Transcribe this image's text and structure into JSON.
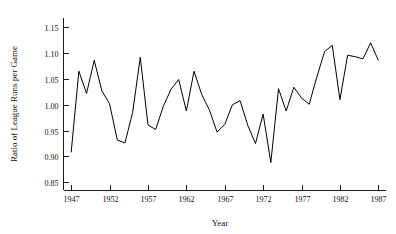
{
  "chart_data": {
    "type": "line",
    "title": "",
    "xlabel": "Year",
    "ylabel": "Ratio of League Runs per Game",
    "xlim": [
      1946,
      1988
    ],
    "ylim": [
      0.835,
      1.168
    ],
    "grid": false,
    "legend": "none",
    "xticks": [
      1947,
      1952,
      1957,
      1962,
      1967,
      1972,
      1977,
      1982,
      1987
    ],
    "xtick_labels": [
      "1947",
      "1952",
      "1957",
      "1962",
      "1967",
      "1972",
      "1977",
      "1982",
      "1987"
    ],
    "yticks": [
      0.85,
      0.9,
      0.95,
      1.0,
      1.05,
      1.1,
      1.15
    ],
    "ytick_labels": [
      "0.85",
      "0.90",
      "0.95",
      "1.00",
      "1.05",
      "1.10",
      "1.15"
    ],
    "x": [
      1947,
      1948,
      1949,
      1950,
      1951,
      1952,
      1953,
      1954,
      1955,
      1956,
      1957,
      1958,
      1959,
      1960,
      1961,
      1962,
      1963,
      1964,
      1965,
      1966,
      1967,
      1968,
      1969,
      1970,
      1971,
      1972,
      1973,
      1974,
      1975,
      1976,
      1977,
      1978,
      1979,
      1980,
      1981,
      1982,
      1983,
      1984,
      1985,
      1986,
      1987
    ],
    "values": [
      0.908,
      1.065,
      1.022,
      1.086,
      1.027,
      1.002,
      0.932,
      0.926,
      0.985,
      1.092,
      0.961,
      0.952,
      0.997,
      1.03,
      1.049,
      0.988,
      1.065,
      1.02,
      0.99,
      0.947,
      0.962,
      1.0,
      1.008,
      0.96,
      0.925,
      0.982,
      0.888,
      1.031,
      0.988,
      1.034,
      1.013,
      1.001,
      1.054,
      1.103,
      1.115,
      1.01,
      1.096,
      1.093,
      1.089,
      1.12,
      1.086
    ],
    "series_name": "League runs per game ratio"
  },
  "axes": {
    "y_axis_title": "Ratio of League Runs per Game",
    "x_axis_title": "Year"
  }
}
